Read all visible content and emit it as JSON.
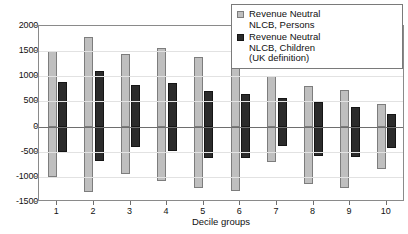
{
  "chart_data": {
    "type": "bar",
    "title": "",
    "xlabel": "Decile groups",
    "ylabel": "",
    "categories": [
      "1",
      "2",
      "3",
      "4",
      "5",
      "6",
      "7",
      "8",
      "9",
      "10"
    ],
    "ylim": [
      -1500,
      2000
    ],
    "ytick_labels": [
      "2000",
      "1500",
      "1000",
      "500",
      "0",
      "-500",
      "-1000",
      "-1500"
    ],
    "ytick_values": [
      2000,
      1500,
      1000,
      500,
      0,
      -500,
      -1000,
      -1500
    ],
    "grid": true,
    "legend_position": "top-right",
    "series": [
      {
        "name": "Revenue Neutral NLCB, Persons",
        "color": "#bfbfbf",
        "positive": [
          1500,
          1780,
          1440,
          1570,
          1390,
          1160,
          1010,
          800,
          720,
          440
        ],
        "negative": [
          -1000,
          -1310,
          -940,
          -1080,
          -1230,
          -1290,
          -700,
          -1140,
          -1220,
          -840
        ]
      },
      {
        "name": "Revenue Neutral NLCB, Children (UK definition)",
        "color": "#2b2b2b",
        "positive": [
          890,
          1110,
          830,
          860,
          700,
          640,
          560,
          480,
          390,
          250
        ],
        "negative": [
          -500,
          -690,
          -400,
          -490,
          -620,
          -620,
          -380,
          -590,
          -610,
          -430
        ]
      }
    ]
  },
  "legend": {
    "entries": [
      {
        "line1": "Revenue Neutral",
        "line2": "NLCB, Persons",
        "line3": ""
      },
      {
        "line1": "Revenue Neutral",
        "line2": "NLCB, Children",
        "line3": "(UK definition)"
      }
    ]
  },
  "axis": {
    "x_title": "Decile groups"
  }
}
